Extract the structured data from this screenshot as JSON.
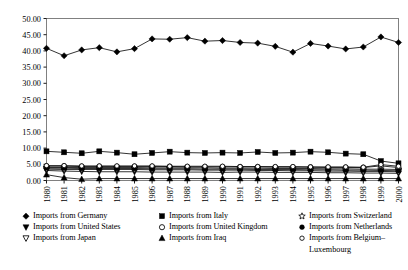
{
  "chart_data": {
    "type": "line",
    "title": "",
    "xlabel": "",
    "ylabel": "",
    "ylim": [
      0,
      50
    ],
    "ytick_step": 5,
    "grid": false,
    "legend_position": "bottom",
    "categories": [
      "1980",
      "1981",
      "1982",
      "1983",
      "1984",
      "1985",
      "1986",
      "1987",
      "1988",
      "1989",
      "1990",
      "1991",
      "1992",
      "1993",
      "1994",
      "1995",
      "1996",
      "1997",
      "1998",
      "1999",
      "2000"
    ],
    "ytick_labels": [
      "0.00",
      "5.00",
      "10.00",
      "15.00",
      "20.00",
      "25.00",
      "30.00",
      "35.00",
      "40.00",
      "45.00",
      "50.00"
    ],
    "series": [
      {
        "name": "Imports from Germany",
        "marker": "filled-diamond",
        "values": [
          40.8,
          38.5,
          40.3,
          41.0,
          39.7,
          40.7,
          43.7,
          43.6,
          44.1,
          43.0,
          43.2,
          42.6,
          42.4,
          41.4,
          39.6,
          42.3,
          41.5,
          40.6,
          41.2,
          44.3,
          42.6
        ]
      },
      {
        "name": "Imports from United States",
        "marker": "filled-down-triangle",
        "values": [
          3.1,
          2.9,
          2.8,
          2.7,
          2.7,
          2.7,
          2.6,
          2.6,
          2.6,
          2.6,
          2.5,
          2.6,
          2.6,
          2.5,
          2.5,
          2.5,
          2.4,
          2.4,
          2.3,
          2.3,
          2.2
        ]
      },
      {
        "name": "Imports from Japan",
        "marker": "open-down-triangle",
        "values": [
          3.5,
          3.4,
          3.4,
          3.4,
          3.4,
          3.4,
          3.3,
          3.3,
          3.3,
          3.2,
          3.2,
          3.2,
          3.1,
          3.1,
          3.0,
          3.0,
          2.9,
          2.9,
          2.8,
          2.8,
          2.7
        ]
      },
      {
        "name": "Imports from Italy",
        "marker": "filled-square",
        "values": [
          9.0,
          8.7,
          8.4,
          9.0,
          8.6,
          8.1,
          8.5,
          8.9,
          8.6,
          8.5,
          8.6,
          8.5,
          8.8,
          8.5,
          8.6,
          8.9,
          8.7,
          8.3,
          8.1,
          6.0,
          5.3
        ]
      },
      {
        "name": "Imports from United Kingdom",
        "marker": "open-circle",
        "values": [
          4.4,
          4.4,
          4.3,
          4.3,
          4.3,
          4.3,
          4.3,
          4.3,
          4.2,
          4.2,
          4.2,
          4.2,
          4.2,
          4.1,
          4.1,
          4.1,
          4.0,
          4.0,
          4.0,
          4.5,
          4.0
        ]
      },
      {
        "name": "Imports from Iraq",
        "marker": "filled-up-triangle",
        "values": [
          1.8,
          0.9,
          0.4,
          0.6,
          0.6,
          0.6,
          0.6,
          0.6,
          0.6,
          0.6,
          0.6,
          0.6,
          0.6,
          0.6,
          0.6,
          0.6,
          0.6,
          0.6,
          0.6,
          0.6,
          0.6
        ]
      },
      {
        "name": "Imports from Switzerland",
        "marker": "open-star",
        "values": [
          4.0,
          4.0,
          4.0,
          4.0,
          4.0,
          4.0,
          3.9,
          3.9,
          3.9,
          3.9,
          3.8,
          3.8,
          3.8,
          3.7,
          3.7,
          3.7,
          3.6,
          3.6,
          3.5,
          3.5,
          3.4
        ]
      },
      {
        "name": "Imports from Netherlands",
        "marker": "filled-circle",
        "values": [
          3.8,
          3.8,
          3.7,
          3.7,
          3.7,
          3.7,
          3.6,
          3.6,
          3.6,
          3.5,
          3.5,
          3.5,
          3.4,
          3.4,
          3.4,
          3.3,
          3.3,
          3.2,
          3.2,
          3.1,
          3.0
        ]
      },
      {
        "name": "Imports from Belgium–Luxembourg",
        "marker": "open-circle-small",
        "values": [
          4.6,
          4.6,
          4.5,
          4.5,
          4.5,
          4.5,
          4.5,
          4.4,
          4.4,
          4.4,
          4.4,
          4.3,
          4.3,
          4.3,
          4.3,
          4.2,
          4.2,
          4.2,
          4.1,
          4.9,
          4.4
        ]
      }
    ]
  },
  "legend": {
    "columns": [
      {
        "items": [
          {
            "label": "Imports from Germany",
            "marker": "filled-diamond"
          },
          {
            "label": "Imports from United States",
            "marker": "filled-down-triangle"
          },
          {
            "label": "Imports from Japan",
            "marker": "open-down-triangle"
          }
        ]
      },
      {
        "items": [
          {
            "label": "Imports from Italy",
            "marker": "filled-square"
          },
          {
            "label": "Imports from United Kingdom",
            "marker": "open-circle"
          },
          {
            "label": "Imports from Iraq",
            "marker": "filled-up-triangle"
          }
        ]
      },
      {
        "items": [
          {
            "label": "Imports from Switzerland",
            "marker": "open-star"
          },
          {
            "label": "Imports from Netherlands",
            "marker": "filled-circle"
          },
          {
            "label": "Imports from Belgium–",
            "marker": "open-circle-small",
            "label2": "Luxembourg"
          }
        ]
      }
    ]
  },
  "colors": {
    "ink": "#000000",
    "background": "#ffffff",
    "axis": "#000000"
  }
}
